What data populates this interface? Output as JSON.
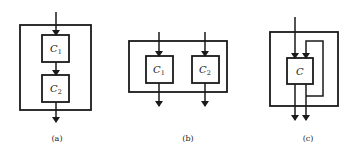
{
  "diagrams": {
    "a": {
      "caption": "(a)",
      "description": "serial composition",
      "components": [
        {
          "name": "C",
          "subscript": "1"
        },
        {
          "name": "C",
          "subscript": "2"
        }
      ]
    },
    "b": {
      "caption": "(b)",
      "description": "parallel composition",
      "components": [
        {
          "name": "C",
          "subscript": "1"
        },
        {
          "name": "C",
          "subscript": "2"
        }
      ]
    },
    "c": {
      "caption": "(c)",
      "description": "feedback composition",
      "components": [
        {
          "name": "C",
          "subscript": ""
        }
      ]
    }
  },
  "colors": {
    "stroke": "#1a1a1a",
    "background": "#ffffff"
  }
}
